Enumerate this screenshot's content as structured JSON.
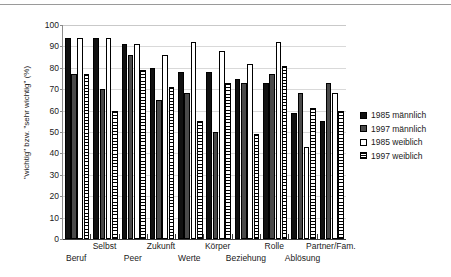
{
  "chart_data": {
    "type": "bar",
    "title": "",
    "xlabel": "",
    "ylabel": "\"wichtig\" bzw. \"sehr wichtig\" (%)",
    "ylim": [
      0,
      100
    ],
    "yticks": [
      0,
      10,
      20,
      30,
      40,
      50,
      60,
      70,
      80,
      90,
      100
    ],
    "grid": true,
    "legend_position": "right",
    "categories": [
      "Beruf",
      "Selbst",
      "Peer",
      "Zukunft",
      "Werte",
      "Körper",
      "Beziehung",
      "Rolle",
      "Ablösung",
      "Partner/Fam."
    ],
    "series": [
      {
        "name": "1985 männlich",
        "color": "#111111",
        "values": [
          94,
          94,
          91,
          80,
          78,
          78,
          75,
          73,
          59,
          55
        ]
      },
      {
        "name": "1997 männlich",
        "color": "#4a4a4a",
        "values": [
          77,
          70,
          86,
          65,
          68,
          50,
          73,
          77,
          68,
          73
        ]
      },
      {
        "name": "1985 weiblich",
        "color": "#ffffff",
        "values": [
          94,
          94,
          91,
          86,
          92,
          88,
          82,
          92,
          43,
          68
        ]
      },
      {
        "name": "1997 weiblich",
        "color": "#ffffff",
        "values": [
          77,
          60,
          79,
          71,
          55,
          73,
          49,
          81,
          61,
          60
        ]
      }
    ]
  },
  "legend": {
    "items": [
      {
        "label": "1985 männlich",
        "swatch": "solid-black-square"
      },
      {
        "label": "1997 männlich",
        "swatch": "solid-gray-square"
      },
      {
        "label": "1985 weiblich",
        "swatch": "open-white-square"
      },
      {
        "label": "1997 weiblich",
        "swatch": "hatched-white-square"
      }
    ]
  },
  "axes": {
    "y_title": "\"wichtig\" bzw. \"sehr wichtig\" (%)",
    "y_ticks": [
      "100",
      "90",
      "80",
      "70",
      "60",
      "50",
      "40",
      "30",
      "20",
      "10",
      "0"
    ],
    "x_labels": [
      "Beruf",
      "Selbst",
      "Peer",
      "Zukunft",
      "Werte",
      "Körper",
      "Beziehung",
      "Rolle",
      "Ablösung",
      "Partner/Fam."
    ]
  }
}
